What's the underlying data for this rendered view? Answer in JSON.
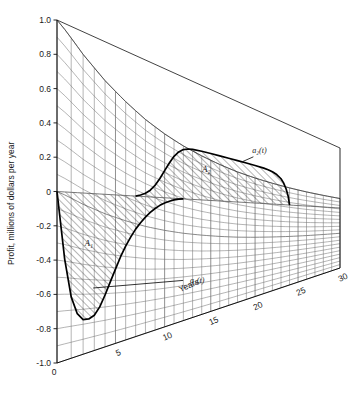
{
  "chart_data": {
    "type": "area",
    "title": "",
    "ylabel": "Profit, millions of dollars per year",
    "xlabel": "Years",
    "ylim": [
      -1.0,
      1.0
    ],
    "xlim": [
      0,
      30
    ],
    "grid": true,
    "legend": "none",
    "projection": "3d-perspective-mesh",
    "yticks": [
      "1.0",
      "0.8",
      "0.6",
      "0.4",
      "0.2",
      "0",
      "-0.2",
      "-0.4",
      "-0.6",
      "-0.8",
      "-1.0"
    ],
    "ytick_values": [
      1.0,
      0.8,
      0.6,
      0.4,
      0.2,
      0,
      -0.2,
      -0.4,
      -0.6,
      -0.8,
      -1.0
    ],
    "xticks": [
      "0",
      "5",
      "10",
      "15",
      "20",
      "25",
      "30"
    ],
    "xtick_values": [
      0,
      5,
      10,
      15,
      20,
      25,
      30
    ],
    "origin_label": "0",
    "annotations": [
      {
        "name": "curve-a1-label",
        "text": "a₁(t)",
        "x": 13.5,
        "y": -0.72
      },
      {
        "name": "curve-a2-label",
        "text": "a₂(t)",
        "x": 20.5,
        "y": 0.55
      },
      {
        "name": "area-a1-label",
        "text": "A₁",
        "x": 2.5,
        "y": -0.33
      },
      {
        "name": "area-a2-label",
        "text": "A₂",
        "x": 14.5,
        "y": 0.25
      }
    ],
    "series": [
      {
        "name": "a1(t)",
        "description": "Early negative cash flow curve, dips to minimum near t=2.5",
        "points": [
          {
            "t": 0,
            "a": 0.0
          },
          {
            "t": 0.5,
            "a": -0.4
          },
          {
            "t": 1.0,
            "a": -0.63
          },
          {
            "t": 1.5,
            "a": -0.74
          },
          {
            "t": 2.0,
            "a": -0.785
          },
          {
            "t": 2.5,
            "a": -0.79
          },
          {
            "t": 3.0,
            "a": -0.775
          },
          {
            "t": 3.5,
            "a": -0.73
          },
          {
            "t": 4.0,
            "a": -0.66
          },
          {
            "t": 4.5,
            "a": -0.58
          },
          {
            "t": 5.0,
            "a": -0.5
          },
          {
            "t": 5.5,
            "a": -0.42
          },
          {
            "t": 6.0,
            "a": -0.35
          },
          {
            "t": 6.5,
            "a": -0.29
          },
          {
            "t": 7.0,
            "a": -0.235
          },
          {
            "t": 7.5,
            "a": -0.19
          },
          {
            "t": 8.0,
            "a": -0.15
          },
          {
            "t": 8.5,
            "a": -0.115
          },
          {
            "t": 9.0,
            "a": -0.085
          },
          {
            "t": 9.5,
            "a": -0.06
          },
          {
            "t": 10.0,
            "a": -0.04
          },
          {
            "t": 10.5,
            "a": -0.025
          },
          {
            "t": 11.0,
            "a": -0.012
          },
          {
            "t": 11.5,
            "a": -0.005
          },
          {
            "t": 12.0,
            "a": 0.0
          }
        ]
      },
      {
        "name": "a2(t)",
        "description": "Later positive cash flow curve, plateaus near 0.42 then drops to zero at t=24",
        "points": [
          {
            "t": 7.0,
            "a": 0.0
          },
          {
            "t": 7.5,
            "a": 0.01
          },
          {
            "t": 8.0,
            "a": 0.025
          },
          {
            "t": 8.5,
            "a": 0.05
          },
          {
            "t": 9.0,
            "a": 0.09
          },
          {
            "t": 9.5,
            "a": 0.145
          },
          {
            "t": 10.0,
            "a": 0.21
          },
          {
            "t": 10.5,
            "a": 0.275
          },
          {
            "t": 11.0,
            "a": 0.335
          },
          {
            "t": 11.5,
            "a": 0.378
          },
          {
            "t": 12.0,
            "a": 0.405
          },
          {
            "t": 12.5,
            "a": 0.418
          },
          {
            "t": 13.0,
            "a": 0.424
          },
          {
            "t": 14.0,
            "a": 0.425
          },
          {
            "t": 15.0,
            "a": 0.423
          },
          {
            "t": 16.0,
            "a": 0.42
          },
          {
            "t": 17.0,
            "a": 0.417
          },
          {
            "t": 18.0,
            "a": 0.413
          },
          {
            "t": 19.0,
            "a": 0.408
          },
          {
            "t": 20.0,
            "a": 0.402
          },
          {
            "t": 21.0,
            "a": 0.393
          },
          {
            "t": 21.5,
            "a": 0.385
          },
          {
            "t": 22.0,
            "a": 0.372
          },
          {
            "t": 22.5,
            "a": 0.35
          },
          {
            "t": 23.0,
            "a": 0.31
          },
          {
            "t": 23.3,
            "a": 0.265
          },
          {
            "t": 23.6,
            "a": 0.195
          },
          {
            "t": 23.85,
            "a": 0.105
          },
          {
            "t": 24.0,
            "a": 0.0
          }
        ]
      }
    ],
    "surface_envelope": {
      "description": "Upper mesh boundary decaying from 1.0 at t=0",
      "points": [
        {
          "t": 0,
          "y": 1.0
        },
        {
          "t": 2,
          "y": 0.86
        },
        {
          "t": 4,
          "y": 0.745
        },
        {
          "t": 6,
          "y": 0.65
        },
        {
          "t": 8,
          "y": 0.565
        },
        {
          "t": 10,
          "y": 0.495
        },
        {
          "t": 12,
          "y": 0.435
        },
        {
          "t": 14,
          "y": 0.385
        },
        {
          "t": 16,
          "y": 0.34
        },
        {
          "t": 18,
          "y": 0.3
        },
        {
          "t": 20,
          "y": 0.268
        },
        {
          "t": 22,
          "y": 0.24
        },
        {
          "t": 24,
          "y": 0.215
        },
        {
          "t": 26,
          "y": 0.193
        },
        {
          "t": 28,
          "y": 0.175
        },
        {
          "t": 30,
          "y": 0.158
        }
      ]
    }
  }
}
